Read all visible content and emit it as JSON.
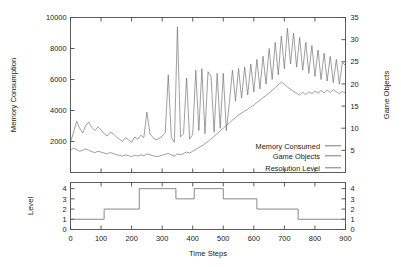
{
  "chart_data": {
    "type": "line",
    "title": "",
    "panels": [
      {
        "name": "main-panel",
        "xlabel": "",
        "xlim": [
          0,
          900
        ],
        "xticks": [
          0,
          100,
          200,
          300,
          400,
          500,
          600,
          700,
          800,
          900
        ],
        "ylabel_left": "Memory Consumption",
        "ylim_left": [
          0,
          10000
        ],
        "yticks_left": [
          2000,
          4000,
          6000,
          8000,
          10000
        ],
        "ylabel_right": "Game Objects",
        "ylim_right": [
          0,
          35
        ],
        "yticks_right": [
          5,
          10,
          15,
          20,
          25,
          30,
          35
        ],
        "grid": false,
        "legend_position": "bottom-right",
        "series": [
          {
            "name": "Memory Consumed",
            "axis": "left",
            "x": [
              0,
              10,
              20,
              30,
              40,
              50,
              60,
              70,
              80,
              90,
              100,
              110,
              120,
              130,
              140,
              150,
              160,
              170,
              180,
              190,
              200,
              210,
              220,
              230,
              240,
              250,
              260,
              270,
              280,
              290,
              300,
              310,
              320,
              330,
              340,
              350,
              360,
              370,
              380,
              390,
              400,
              410,
              420,
              430,
              440,
              450,
              460,
              470,
              480,
              490,
              500,
              510,
              520,
              530,
              540,
              550,
              560,
              570,
              580,
              590,
              600,
              610,
              620,
              630,
              640,
              650,
              660,
              670,
              680,
              690,
              700,
              710,
              720,
              730,
              740,
              750,
              760,
              770,
              780,
              790,
              800,
              810,
              820,
              830,
              840,
              850,
              860,
              870,
              880,
              890,
              900
            ],
            "values": [
              1950,
              2600,
              3300,
              2850,
              2550,
              3050,
              3250,
              2900,
              2700,
              2950,
              2750,
              2500,
              2350,
              2600,
              2500,
              2300,
              2150,
              2000,
              2250,
              2100,
              1950,
              2300,
              2150,
              2400,
              2250,
              3900,
              2500,
              2250,
              2100,
              2200,
              2350,
              2550,
              6300,
              2250,
              1950,
              9400,
              2300,
              2500,
              6100,
              2150,
              2450,
              6600,
              2700,
              6700,
              2500,
              6500,
              6200,
              2600,
              6400,
              2850,
              6400,
              2700,
              4500,
              6600,
              4600,
              6700,
              4800,
              6800,
              5000,
              7000,
              5200,
              7300,
              5400,
              7500,
              5700,
              8000,
              6000,
              8400,
              6300,
              8800,
              6700,
              9300,
              7000,
              9000,
              6800,
              8700,
              6600,
              8400,
              6400,
              8200,
              6200,
              7900,
              6000,
              7700,
              5900,
              7500,
              5800,
              7300,
              5700,
              7100,
              6900
            ]
          },
          {
            "name": "Game Objects",
            "axis": "right",
            "x": [
              0,
              10,
              20,
              30,
              40,
              50,
              60,
              70,
              80,
              90,
              100,
              110,
              120,
              130,
              140,
              150,
              160,
              170,
              180,
              190,
              200,
              210,
              220,
              230,
              240,
              250,
              260,
              270,
              280,
              290,
              300,
              310,
              320,
              330,
              340,
              350,
              360,
              370,
              380,
              390,
              400,
              410,
              420,
              430,
              440,
              450,
              460,
              470,
              480,
              490,
              500,
              510,
              520,
              530,
              540,
              550,
              560,
              570,
              580,
              590,
              600,
              610,
              620,
              630,
              640,
              650,
              660,
              670,
              680,
              690,
              700,
              710,
              720,
              730,
              740,
              750,
              760,
              770,
              780,
              790,
              800,
              810,
              820,
              830,
              840,
              850,
              860,
              870,
              880,
              890,
              900
            ],
            "values": [
              5.0,
              5.5,
              5.2,
              4.8,
              5.0,
              5.3,
              5.0,
              4.7,
              4.5,
              4.8,
              4.6,
              4.4,
              4.2,
              4.5,
              4.3,
              4.0,
              3.9,
              3.7,
              4.0,
              3.8,
              3.6,
              3.9,
              3.7,
              4.0,
              3.8,
              4.2,
              4.0,
              3.8,
              3.6,
              3.7,
              3.9,
              4.1,
              4.3,
              4.0,
              3.7,
              4.2,
              4.0,
              4.3,
              4.6,
              4.4,
              4.8,
              5.2,
              5.6,
              6.0,
              6.5,
              7.0,
              7.6,
              8.2,
              8.8,
              9.4,
              10.0,
              10.6,
              11.2,
              11.8,
              12.4,
              13.0,
              13.4,
              13.9,
              14.3,
              14.8,
              15.2,
              15.8,
              16.3,
              16.9,
              17.4,
              18.0,
              18.5,
              19.2,
              19.8,
              20.4,
              19.9,
              19.3,
              18.8,
              18.3,
              17.9,
              17.5,
              18.1,
              17.6,
              18.2,
              17.8,
              18.4,
              17.9,
              18.5,
              18.0,
              18.6,
              18.1,
              18.7,
              18.2,
              17.8,
              18.3,
              17.9
            ]
          }
        ],
        "legend": [
          {
            "label": "Memory Consumed"
          },
          {
            "label": "Game Objects"
          },
          {
            "label": "Resolution Level"
          }
        ]
      },
      {
        "name": "resolution-panel",
        "xlabel": "Time Steps",
        "xlim": [
          0,
          900
        ],
        "xticks": [
          0,
          100,
          200,
          300,
          400,
          500,
          600,
          700,
          800,
          900
        ],
        "ylabel_left": "Level",
        "ylim_left": [
          0,
          4.6
        ],
        "yticks_left": [
          0,
          1,
          2,
          3,
          4
        ],
        "yticks_right": [
          0,
          1,
          2,
          3,
          4
        ],
        "grid": false,
        "series": [
          {
            "name": "Resolution Level",
            "axis": "left",
            "steps": [
              {
                "x": 0,
                "value": 1
              },
              {
                "x": 110,
                "value": 2
              },
              {
                "x": 225,
                "value": 4
              },
              {
                "x": 345,
                "value": 3
              },
              {
                "x": 405,
                "value": 4
              },
              {
                "x": 500,
                "value": 3
              },
              {
                "x": 610,
                "value": 2
              },
              {
                "x": 745,
                "value": 1
              },
              {
                "x": 900,
                "value": 1
              }
            ]
          }
        ]
      }
    ],
    "colors": {
      "line": "#6b6b6b",
      "axis": "#4a4a4a",
      "text": "#1a1a1a",
      "background": "#ffffff"
    }
  }
}
